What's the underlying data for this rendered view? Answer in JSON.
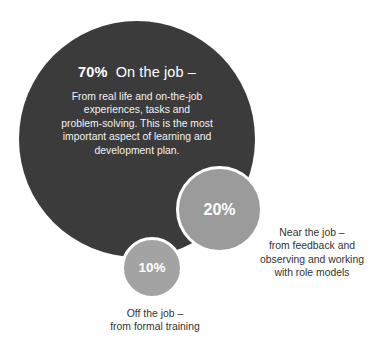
{
  "chart_data": {
    "type": "pie",
    "categories": [
      "On the job",
      "Near the job",
      "Off the job"
    ],
    "values": [
      70,
      20,
      10
    ],
    "unit": "%",
    "legend_position": "inline",
    "grid": false,
    "slices": [
      {
        "label": "On the job",
        "percent_text": "70%",
        "value": 70,
        "color": "#3b3b3b",
        "description": "From real life and on-the-job experiences, tasks and problem-solving. This is the most important aspect of learning and development plan."
      },
      {
        "label": "Near the job",
        "percent_text": "20%",
        "value": 20,
        "color": "#9b9b9b",
        "description": "from feedback and observing and working with role models"
      },
      {
        "label": "Off the job",
        "percent_text": "10%",
        "value": 10,
        "color": "#a3a3a3",
        "description": "from formal training"
      }
    ]
  },
  "primary": {
    "percent": "70%",
    "label": "On the job –",
    "body_line_1": "From real life and on-the-job",
    "body_line_2": "experiences, tasks and",
    "body_line_3": "problem-solving. This is the most",
    "body_line_4": "important aspect of learning and",
    "body_line_5": "development plan."
  },
  "secondary": {
    "percent": "20%",
    "caption_line_1": "Near the job –",
    "caption_line_2": "from feedback and",
    "caption_line_3": "observing and working",
    "caption_line_4": "with role models"
  },
  "tertiary": {
    "percent": "10%",
    "caption_line_1": "Off the job –",
    "caption_line_2": "from formal training"
  },
  "colors": {
    "primary_bubble": "#3b3b3b",
    "secondary_bubble": "#9b9b9b",
    "tertiary_bubble": "#a3a3a3",
    "bubble_text": "#ffffff",
    "caption_text": "#333333",
    "background": "#ffffff"
  }
}
